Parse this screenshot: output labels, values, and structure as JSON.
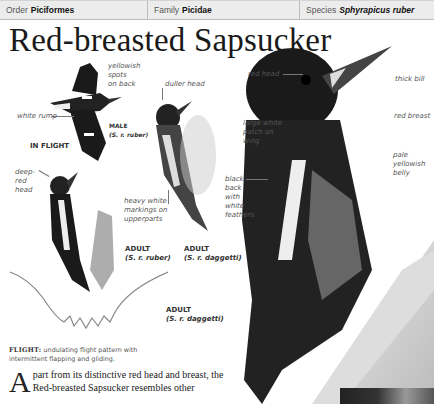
{
  "header": {
    "order": {
      "label": "Order",
      "value": "Piciformes"
    },
    "family": {
      "label": "Family",
      "value": "Picidae"
    },
    "species": {
      "label": "Species",
      "value": "Sphyrapicus ruber"
    }
  },
  "title": "Red-breasted Sapsucker",
  "annotations": {
    "yellowish_spots": [
      "yellowish",
      "spots",
      "on back"
    ],
    "white_rump": "white rump",
    "male_caption": {
      "title": "MALE",
      "sub": "(S. r. ruber)"
    },
    "in_flight": "IN FLIGHT",
    "duller_head": "duller head",
    "deep_red_head": [
      "deep-",
      "red",
      "head"
    ],
    "heavy_white": [
      "heavy white",
      "markings on",
      "upperparts"
    ],
    "adult_ruber": {
      "title": "ADULT",
      "sub": "(S. r. ruber)"
    },
    "adult_daggetti_small": {
      "title": "ADULT",
      "sub": "(S. r. daggetti)"
    },
    "adult_daggetti_large": {
      "title": "ADULT",
      "sub": "(S. r. daggetti)"
    },
    "red_head": "red head",
    "thick_bill": "thick bill",
    "large_white_patch": [
      "large white",
      "patch on",
      "wing"
    ],
    "red_breast": "red breast",
    "black_back": [
      "black",
      "back",
      "with",
      "white",
      "feathers"
    ],
    "pale_belly": [
      "pale",
      "yellowish",
      "belly"
    ]
  },
  "flight": {
    "label": "FLIGHT:",
    "text": "undulating flight pattern with intermittent flapping and gliding."
  },
  "body": {
    "dropcap": "A",
    "text": "part from its distinctive red head and breast, the Red-breasted Sapsucker resembles other"
  }
}
